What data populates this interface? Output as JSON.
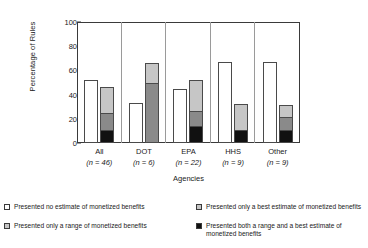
{
  "chart_data": {
    "type": "bar",
    "subtype": "grouped-stacked",
    "title": "",
    "xlabel": "Agencies",
    "ylabel": "Percentage of Rules",
    "ylim": [
      0,
      100
    ],
    "yticks": [
      0,
      20,
      40,
      60,
      80,
      100
    ],
    "grid": false,
    "legend_position": "bottom",
    "categories": [
      "All",
      "DOT",
      "EPA",
      "HHS",
      "Other"
    ],
    "category_notes": [
      "(n = 46)",
      "(n = 6)",
      "(n = 22)",
      "(n = 9)",
      "(n = 9)"
    ],
    "series": [
      {
        "name": "Presented no estimate of monetized benefits",
        "color": "#ffffff",
        "stack": "A",
        "values": [
          52,
          33,
          45,
          67,
          67
        ]
      },
      {
        "name": "Presented both a range and a best estimate of monetized benefits",
        "color": "#111111",
        "stack": "B",
        "values": [
          11,
          0,
          14,
          11,
          11
        ]
      },
      {
        "name": "Presented only a range of monetized benefits",
        "color": "#8a8a8a",
        "stack": "B",
        "values": [
          15,
          50,
          13,
          0,
          11
        ]
      },
      {
        "name": "Presented only a best estimate of monetized benefits",
        "color": "#c6c6c6",
        "stack": "B",
        "values": [
          22,
          17,
          27,
          22,
          11
        ]
      }
    ],
    "stack_totals": {
      "no_estimate": [
        52,
        33,
        45,
        67,
        67
      ],
      "combined": [
        48,
        67,
        54,
        33,
        33
      ]
    }
  },
  "axis": {
    "y_title": "Percentage of Rules",
    "x_title": "Agencies",
    "y_ticks": [
      "100",
      "80",
      "60",
      "40",
      "20",
      "0"
    ]
  },
  "xlabels": [
    {
      "name": "All",
      "n": "(n = 46)"
    },
    {
      "name": "DOT",
      "n": "(n = 6)"
    },
    {
      "name": "EPA",
      "n": "(n = 22)"
    },
    {
      "name": "HHS",
      "n": "(n = 9)"
    },
    {
      "name": "Other",
      "n": "(n = 9)"
    }
  ],
  "legend": {
    "items": [
      {
        "label": "Presented no estimate of monetized benefits",
        "color": "#ffffff"
      },
      {
        "label": "Presented only a best estimate of monetized benefits",
        "color": "#c6c6c6"
      },
      {
        "label": "Presented only a range of monetized benefits",
        "color": "#c6c6c6"
      },
      {
        "label": "Presented both a range and a best estimate of monetized benefits",
        "color": "#111111"
      }
    ]
  }
}
